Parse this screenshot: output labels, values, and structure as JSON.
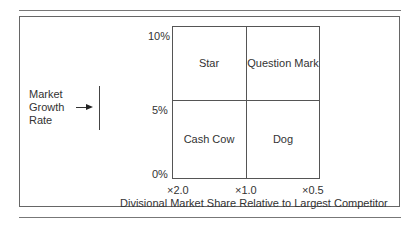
{
  "diagram": {
    "type": "bcg-matrix",
    "y_axis": {
      "label_lines": [
        "Market",
        "Growth",
        "Rate"
      ],
      "ticks": [
        "10%",
        "5%",
        "0%"
      ]
    },
    "x_axis": {
      "label": "Divisional Market Share Relative to Largest Competitor",
      "ticks": [
        "×2.0",
        "×1.0",
        "×0.5"
      ]
    },
    "quadrants": {
      "top_left": "Star",
      "top_right": "Question Mark",
      "bottom_left": "Cash Cow",
      "bottom_right": "Dog"
    }
  },
  "colors": {
    "line": "#555555",
    "text": "#333333",
    "background": "#ffffff"
  }
}
